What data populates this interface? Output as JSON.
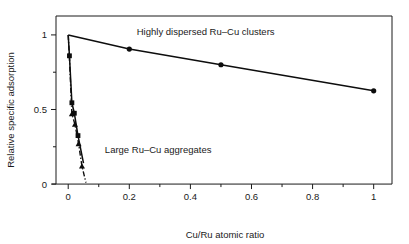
{
  "chart_data": {
    "type": "line",
    "title": "",
    "xlabel": "Cu/Ru atomic ratio",
    "ylabel": "Relative specific adsorption",
    "xlim": [
      -0.04,
      1.06
    ],
    "ylim": [
      -0.08,
      1.1
    ],
    "grid": false,
    "legend_position": "inline-annotations",
    "xticks": [
      0,
      0.2,
      0.4,
      0.6,
      0.8,
      1
    ],
    "xticklabels": [
      "0",
      "0.2",
      "0.4",
      "0.6",
      "0.8",
      "1"
    ],
    "xminorticks": [
      0.1,
      0.3,
      0.5,
      0.7,
      0.9
    ],
    "yticks": [
      0,
      0.5,
      1
    ],
    "yticklabels": [
      "0",
      "0.5",
      "1"
    ],
    "yminorticks": [
      0.25,
      0.75
    ],
    "series": [
      {
        "name": "Highly dispersed Ru-Cu clusters",
        "marker": "circle",
        "linestyle": "solid",
        "color": "#0d0d0d",
        "x": [
          0,
          0.2,
          0.5,
          1
        ],
        "y": [
          1.0,
          0.905,
          0.8,
          0.625
        ],
        "marker_x": [
          0.2,
          0.5,
          1
        ],
        "marker_y": [
          0.905,
          0.8,
          0.625
        ]
      },
      {
        "name": "Large Ru-Cu aggregates (squares)",
        "marker": "square",
        "linestyle": "solid",
        "color": "#0d0d0d",
        "x": [
          0,
          0.004,
          0.012,
          0.02,
          0.032,
          0.05
        ],
        "y": [
          1.0,
          0.86,
          0.545,
          0.475,
          0.325,
          0.14
        ],
        "marker_x": [
          0.004,
          0.012,
          0.02,
          0.032
        ],
        "marker_y": [
          0.86,
          0.545,
          0.475,
          0.325
        ]
      },
      {
        "name": "Large Ru-Cu aggregates (triangles)",
        "marker": "triangle",
        "linestyle": "dashdot",
        "color": "#0d0d0d",
        "x": [
          0,
          0.004,
          0.012,
          0.022,
          0.034,
          0.045,
          0.058
        ],
        "y": [
          1.0,
          0.845,
          0.47,
          0.4,
          0.27,
          0.12,
          0.01
        ],
        "marker_x": [
          0.012,
          0.022,
          0.034,
          0.045
        ],
        "marker_y": [
          0.47,
          0.4,
          0.27,
          0.12
        ]
      }
    ],
    "annotations": [
      {
        "id": "upper-curve-label",
        "text": "Highly dispersed Ru–Cu clusters",
        "x": 0.45,
        "y": 1.0,
        "anchor": "middle"
      },
      {
        "id": "lower-curve-label",
        "text": "Large Ru–Cu aggregates",
        "x": 0.12,
        "y": 0.21,
        "anchor": "start"
      }
    ]
  }
}
